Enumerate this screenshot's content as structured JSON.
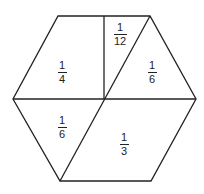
{
  "diagram": {
    "shape": "hexagon",
    "stroke_color": "#222222",
    "regions": [
      {
        "name": "upper-left",
        "numerator": "1",
        "denominator": "4",
        "x": 62,
        "y": 55
      },
      {
        "name": "top-center",
        "numerator": "1",
        "denominator": "12",
        "x": 119,
        "y": 22
      },
      {
        "name": "upper-right",
        "numerator": "1",
        "denominator": "6",
        "x": 152,
        "y": 57
      },
      {
        "name": "lower-left",
        "numerator": "1",
        "denominator": "6",
        "x": 62,
        "y": 115
      },
      {
        "name": "lower-right",
        "numerator": "1",
        "denominator": "3",
        "x": 124,
        "y": 130
      }
    ]
  }
}
